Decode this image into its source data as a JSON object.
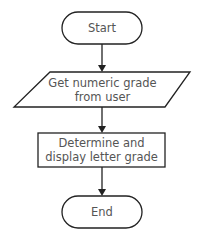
{
  "diagram": {
    "type": "flowchart",
    "nodes": [
      {
        "id": "start",
        "shape": "terminal",
        "label": "Start"
      },
      {
        "id": "input",
        "shape": "parallelogram",
        "label_lines": [
          "Get numeric grade",
          "from user"
        ]
      },
      {
        "id": "process",
        "shape": "rectangle",
        "label_lines": [
          "Determine and",
          "display letter grade"
        ]
      },
      {
        "id": "end",
        "shape": "terminal",
        "label": "End"
      }
    ],
    "edges": [
      {
        "from": "start",
        "to": "input"
      },
      {
        "from": "input",
        "to": "process"
      },
      {
        "from": "process",
        "to": "end"
      }
    ],
    "colors": {
      "stroke": "#222222",
      "text": "#555555",
      "background": "#ffffff"
    }
  }
}
